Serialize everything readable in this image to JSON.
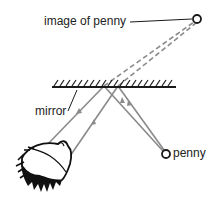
{
  "diagram": {
    "labels": {
      "image": "image of penny",
      "mirror": "mirror",
      "penny": "penny"
    },
    "colors": {
      "ray": "#8a8a8a",
      "ink": "#1a1a1a",
      "background": "#ffffff"
    },
    "points": {
      "image_of_penny": [
        197,
        19
      ],
      "penny": [
        166,
        154
      ],
      "mirror_start": [
        52,
        86
      ],
      "mirror_end": [
        176,
        86
      ],
      "reflect_left": [
        104,
        86
      ],
      "reflect_right": [
        118,
        86
      ],
      "eye_left": [
        45,
        147
      ],
      "eye_right": [
        66,
        162
      ]
    },
    "rays": [
      {
        "from": "penny",
        "to": "reflect_left",
        "style": "solid",
        "arrow": "toward-mirror"
      },
      {
        "from": "penny",
        "to": "reflect_right",
        "style": "solid",
        "arrow": "toward-mirror"
      },
      {
        "from": "reflect_left",
        "to": "eye_left",
        "style": "solid",
        "arrow": "toward-eye"
      },
      {
        "from": "reflect_right",
        "to": "eye_right",
        "style": "solid",
        "arrow": "toward-eye"
      },
      {
        "from": "reflect_left",
        "to": "image_of_penny",
        "style": "dashed",
        "arrow": "none"
      },
      {
        "from": "reflect_right",
        "to": "image_of_penny",
        "style": "dashed",
        "arrow": "none"
      }
    ]
  }
}
